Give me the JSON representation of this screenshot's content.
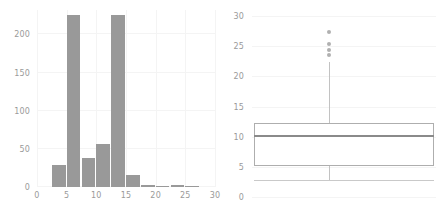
{
  "chart_data": [
    {
      "type": "bar",
      "panel": "left",
      "title": "",
      "subtitle": "",
      "xlabel": "",
      "ylabel": "",
      "grid": true,
      "legend": "none",
      "orientation": "vertical",
      "bin_width": 2.5,
      "xlim": [
        0,
        30
      ],
      "ylim": [
        0,
        232
      ],
      "xticks": [
        0,
        5,
        10,
        15,
        20,
        25,
        30
      ],
      "yticks": [
        0,
        50,
        100,
        150,
        200
      ],
      "bin_edges": [
        2.5,
        5.0,
        7.5,
        10.0,
        12.5,
        15.0,
        17.5,
        20.0,
        22.5,
        25.0,
        27.5
      ],
      "categories": [
        "2.5-5",
        "5-7.5",
        "7.5-10",
        "10-12.5",
        "12.5-15",
        "15-17.5",
        "17.5-20",
        "20-22.5",
        "22.5-25",
        "25-27.5"
      ],
      "values": [
        29,
        226,
        38,
        57,
        226,
        16,
        3,
        1,
        3,
        1
      ],
      "bar_color": "#999999"
    },
    {
      "type": "box",
      "panel": "right",
      "title": "",
      "subtitle": "",
      "xlabel": "",
      "ylabel": "",
      "grid": true,
      "legend": "none",
      "orientation": "horizontal",
      "ylim": [
        0,
        31
      ],
      "yticks": [
        0,
        5,
        10,
        15,
        20,
        25,
        30
      ],
      "stats": {
        "whisker_low": 2.8,
        "q1": 5.2,
        "median": 10.2,
        "q3": 12.3,
        "whisker_high": 22.3
      },
      "outliers": [
        23.6,
        24.3,
        25.3,
        27.4
      ],
      "box_fill": "#ffffff",
      "box_edge": "#aeaeae",
      "median_color": "#8a8a8a"
    }
  ],
  "left_panel": {
    "name": "histogram-panel",
    "yticks": [
      "0",
      "50",
      "100",
      "150",
      "200"
    ],
    "xticks": [
      "0",
      "5",
      "10",
      "15",
      "20",
      "25",
      "30"
    ]
  },
  "right_panel": {
    "name": "boxplot-panel",
    "yticks": [
      "0",
      "5",
      "10",
      "15",
      "20",
      "25",
      "30"
    ]
  }
}
